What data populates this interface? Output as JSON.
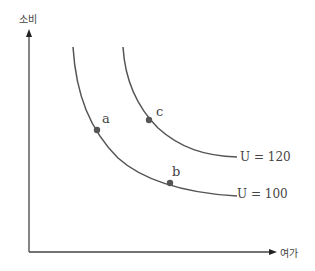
{
  "diagram": {
    "type": "indifference-curves",
    "y_axis_label": "소비",
    "x_axis_label": "여가",
    "colors": {
      "axis": "#444444",
      "curve": "#555555",
      "point": "#555555"
    },
    "curves": [
      {
        "id": "u100",
        "label": "U = 100"
      },
      {
        "id": "u120",
        "label": "U = 120"
      }
    ],
    "points": [
      {
        "id": "a",
        "label": "a",
        "curve": "U = 100"
      },
      {
        "id": "b",
        "label": "b",
        "curve": "U = 100"
      },
      {
        "id": "c",
        "label": "c",
        "curve": "U = 120"
      }
    ]
  }
}
